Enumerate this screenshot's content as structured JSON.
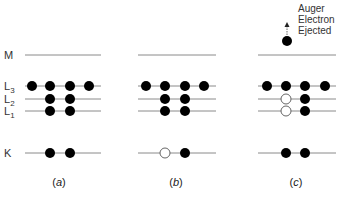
{
  "colors": {
    "line": "#8a8a8a",
    "electron": "#000000",
    "hole_fill": "#ffffff",
    "hole_stroke": "#555555"
  },
  "levels": [
    {
      "name": "M",
      "label": "M",
      "sub": "",
      "y": 55
    },
    {
      "name": "L3",
      "label": "L",
      "sub": "3",
      "y": 86
    },
    {
      "name": "L2",
      "label": "L",
      "sub": "2",
      "y": 99
    },
    {
      "name": "L1",
      "label": "L",
      "sub": "1",
      "y": 111
    },
    {
      "name": "K",
      "label": "K",
      "sub": "",
      "y": 153
    }
  ],
  "panels": [
    {
      "id": "a",
      "caption_open": "(",
      "caption_letter": "a",
      "caption_close": ")",
      "x0": 25,
      "x1": 101,
      "caption_x": 59,
      "electrons": {
        "L3": [
          {
            "x": 32,
            "s": "filled"
          },
          {
            "x": 50,
            "s": "filled"
          },
          {
            "x": 70,
            "s": "filled"
          },
          {
            "x": 89,
            "s": "filled"
          }
        ],
        "L2": [
          {
            "x": 50,
            "s": "filled"
          },
          {
            "x": 70,
            "s": "filled"
          }
        ],
        "L1": [
          {
            "x": 50,
            "s": "filled"
          },
          {
            "x": 70,
            "s": "filled"
          }
        ],
        "K": [
          {
            "x": 50,
            "s": "filled"
          },
          {
            "x": 70,
            "s": "filled"
          }
        ]
      }
    },
    {
      "id": "b",
      "caption_open": "(",
      "caption_letter": "b",
      "caption_close": ")",
      "x0": 138,
      "x1": 216,
      "caption_x": 176,
      "electrons": {
        "L3": [
          {
            "x": 146,
            "s": "filled"
          },
          {
            "x": 165,
            "s": "filled"
          },
          {
            "x": 185,
            "s": "filled"
          },
          {
            "x": 204,
            "s": "filled"
          }
        ],
        "L2": [
          {
            "x": 165,
            "s": "filled"
          },
          {
            "x": 185,
            "s": "filled"
          }
        ],
        "L1": [
          {
            "x": 165,
            "s": "filled"
          },
          {
            "x": 185,
            "s": "filled"
          }
        ],
        "K": [
          {
            "x": 165,
            "s": "hole"
          },
          {
            "x": 185,
            "s": "filled"
          }
        ]
      }
    },
    {
      "id": "c",
      "caption_open": "(",
      "caption_letter": "c",
      "caption_close": ")",
      "x0": 258,
      "x1": 336,
      "caption_x": 296,
      "electrons": {
        "L3": [
          {
            "x": 267,
            "s": "filled"
          },
          {
            "x": 286,
            "s": "filled"
          },
          {
            "x": 305,
            "s": "filled"
          },
          {
            "x": 325,
            "s": "filled"
          }
        ],
        "L2": [
          {
            "x": 286,
            "s": "hole"
          },
          {
            "x": 305,
            "s": "filled"
          }
        ],
        "L1": [
          {
            "x": 286,
            "s": "hole"
          },
          {
            "x": 305,
            "s": "filled"
          }
        ],
        "K": [
          {
            "x": 286,
            "s": "filled"
          },
          {
            "x": 305,
            "s": "filled"
          }
        ]
      },
      "ejected": {
        "x": 287,
        "y": 41,
        "arrow_top": 22
      },
      "annotation": [
        "Auger",
        "Electron",
        "Ejected"
      ]
    }
  ],
  "captions": {
    "a": "(a)",
    "b": "(b)",
    "c": "(c)"
  }
}
